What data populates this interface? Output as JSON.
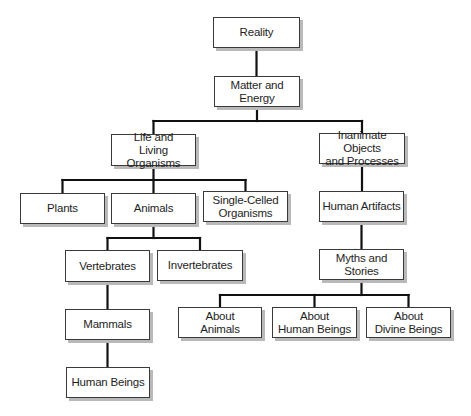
{
  "diagram": {
    "type": "hierarchy-tree",
    "edge_color": "#111111",
    "node_border_color": "#3a3a3a",
    "node_shadow_color": "#b9b9b9",
    "nodes": [
      {
        "id": "reality",
        "label": "Reality",
        "x": 213,
        "y": 17,
        "w": 87,
        "h": 31
      },
      {
        "id": "matter",
        "label": "Matter and\nEnergy",
        "x": 214,
        "y": 76,
        "w": 86,
        "h": 31
      },
      {
        "id": "life",
        "label": "Life and\nLiving Organisms",
        "x": 111,
        "y": 134,
        "w": 85,
        "h": 32
      },
      {
        "id": "inanimate",
        "label": "Inanimate Objects\nand Processes",
        "x": 319,
        "y": 133,
        "w": 86,
        "h": 31
      },
      {
        "id": "plants",
        "label": "Plants",
        "x": 20,
        "y": 193,
        "w": 85,
        "h": 31
      },
      {
        "id": "animals",
        "label": "Animals",
        "x": 111,
        "y": 193,
        "w": 85,
        "h": 31
      },
      {
        "id": "single",
        "label": "Single-Celled\nOrganisms",
        "x": 203,
        "y": 191,
        "w": 85,
        "h": 31
      },
      {
        "id": "artifacts",
        "label": "Human Artifacts",
        "x": 319,
        "y": 191,
        "w": 85,
        "h": 31
      },
      {
        "id": "vertebrates",
        "label": "Vertebrates",
        "x": 65,
        "y": 250,
        "w": 85,
        "h": 32
      },
      {
        "id": "invertebrates",
        "label": "Invertebrates",
        "x": 157,
        "y": 250,
        "w": 86,
        "h": 31
      },
      {
        "id": "myths",
        "label": "Myths and\nStories",
        "x": 319,
        "y": 249,
        "w": 85,
        "h": 31
      },
      {
        "id": "mammals",
        "label": "Mammals",
        "x": 65,
        "y": 309,
        "w": 85,
        "h": 31
      },
      {
        "id": "about_animals",
        "label": "About\nAnimals",
        "x": 178,
        "y": 307,
        "w": 84,
        "h": 31
      },
      {
        "id": "about_humans",
        "label": "About\nHuman Beings",
        "x": 272,
        "y": 307,
        "w": 85,
        "h": 31
      },
      {
        "id": "about_divine",
        "label": "About\nDivine Beings",
        "x": 366,
        "y": 307,
        "w": 85,
        "h": 31
      },
      {
        "id": "humans",
        "label": "Human Beings",
        "x": 66,
        "y": 367,
        "w": 84,
        "h": 31
      }
    ],
    "edges": [
      {
        "from": "reality",
        "to": "matter"
      },
      {
        "from": "matter",
        "to": "life"
      },
      {
        "from": "matter",
        "to": "inanimate"
      },
      {
        "from": "life",
        "to": "plants"
      },
      {
        "from": "life",
        "to": "animals"
      },
      {
        "from": "life",
        "to": "single"
      },
      {
        "from": "animals",
        "to": "vertebrates"
      },
      {
        "from": "animals",
        "to": "invertebrates"
      },
      {
        "from": "vertebrates",
        "to": "mammals"
      },
      {
        "from": "mammals",
        "to": "humans"
      },
      {
        "from": "inanimate",
        "to": "artifacts"
      },
      {
        "from": "artifacts",
        "to": "myths"
      },
      {
        "from": "myths",
        "to": "about_animals"
      },
      {
        "from": "myths",
        "to": "about_humans"
      },
      {
        "from": "myths",
        "to": "about_divine"
      }
    ]
  }
}
